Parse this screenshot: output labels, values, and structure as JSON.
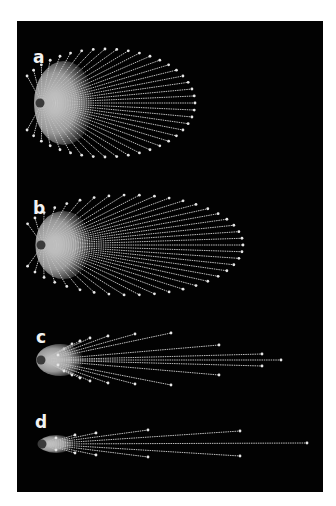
{
  "figure": {
    "background": "#020202",
    "ray_color": "#bdbdbd",
    "tip_color": "#e6e6e6",
    "glow_color": "#d9d9d9",
    "dot_color": "#3a3a3a"
  },
  "panels": [
    {
      "label": "a",
      "label_pos": [
        33,
        49
      ],
      "origin": [
        40,
        103
      ],
      "mode": "ellipse",
      "count": 41,
      "ellipse": {
        "cx": 105,
        "cy": 103,
        "rx": 90,
        "ry": 54
      },
      "arc_start_deg": -150,
      "arc_end_deg": 150,
      "glow": {
        "rx": 30,
        "ry": 42
      }
    },
    {
      "label": "b",
      "label_pos": [
        33,
        200
      ],
      "origin": [
        41,
        245
      ],
      "mode": "ellipse",
      "count": 41,
      "ellipse": {
        "cx": 130,
        "cy": 245,
        "rx": 113,
        "ry": 50
      },
      "arc_start_deg": -155,
      "arc_end_deg": 155,
      "glow": {
        "rx": 28,
        "ry": 34
      }
    },
    {
      "label": "c",
      "label_pos": [
        36,
        329
      ],
      "origin": [
        41,
        360
      ],
      "mode": "tips",
      "tips": [
        [
          64,
          349
        ],
        [
          72,
          344
        ],
        [
          80,
          341
        ],
        [
          90,
          338
        ],
        [
          108,
          336
        ],
        [
          135,
          334
        ],
        [
          171,
          333
        ],
        [
          219,
          345
        ],
        [
          262,
          354
        ],
        [
          281,
          360
        ],
        [
          262,
          366
        ],
        [
          219,
          375
        ],
        [
          171,
          385
        ],
        [
          135,
          384
        ],
        [
          108,
          383
        ],
        [
          90,
          381
        ],
        [
          80,
          378
        ],
        [
          72,
          375
        ],
        [
          64,
          371
        ],
        [
          58,
          365
        ],
        [
          58,
          355
        ]
      ],
      "glow": {
        "rx": 24,
        "ry": 16
      }
    },
    {
      "label": "d",
      "label_pos": [
        35,
        414
      ],
      "origin": [
        42,
        444
      ],
      "mode": "tips",
      "tips": [
        [
          56,
          438
        ],
        [
          75,
          435
        ],
        [
          96,
          433
        ],
        [
          148,
          430
        ],
        [
          240,
          431
        ],
        [
          307,
          443
        ],
        [
          240,
          456
        ],
        [
          148,
          457
        ],
        [
          96,
          455
        ],
        [
          75,
          453
        ],
        [
          56,
          450
        ]
      ],
      "glow": {
        "rx": 18,
        "ry": 9
      }
    }
  ]
}
